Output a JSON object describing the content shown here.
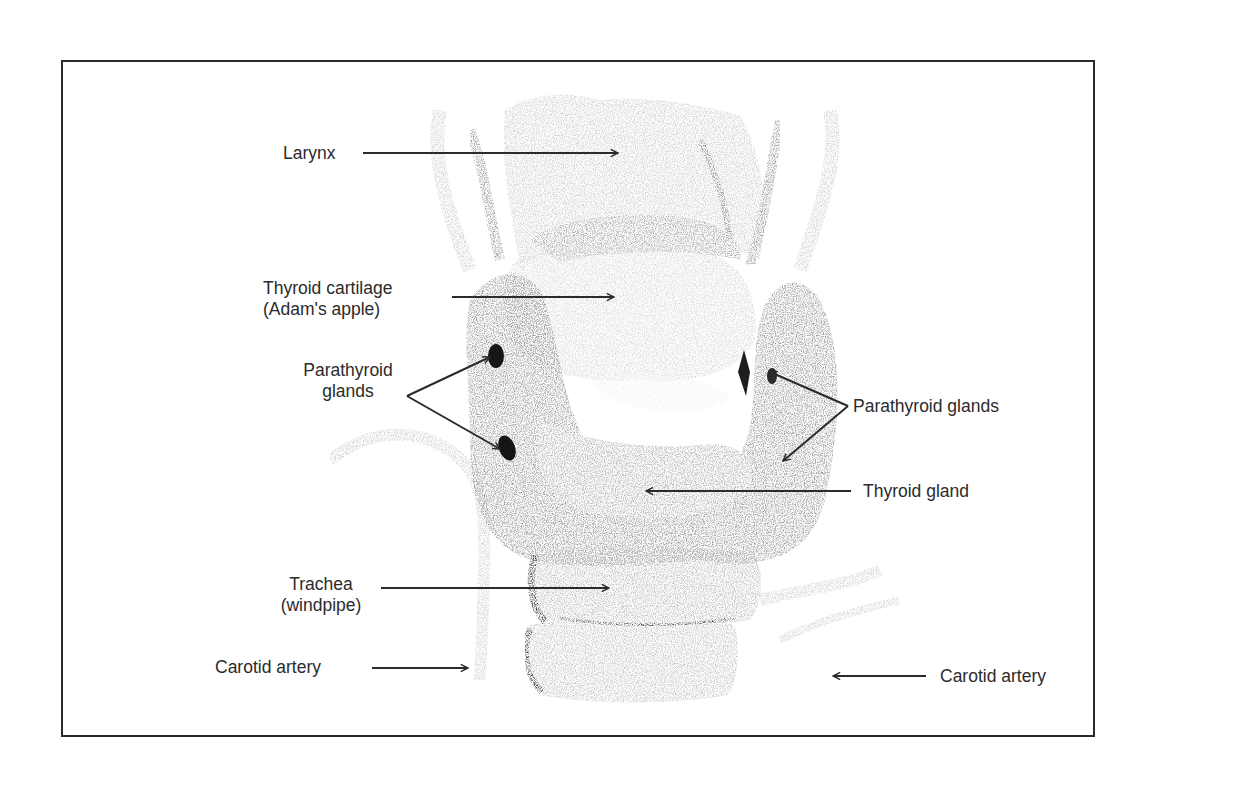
{
  "figure": {
    "type": "anatomical-illustration"
  },
  "labels": {
    "larynx": "Larynx",
    "thyroid_cartilage_line1": "Thyroid cartilage",
    "thyroid_cartilage_line2": "(Adam's apple)",
    "parathyroid_left_line1": "Parathyroid",
    "parathyroid_left_line2": "glands",
    "parathyroid_right": "Parathyroid glands",
    "thyroid_gland": "Thyroid gland",
    "trachea_line1": "Trachea",
    "trachea_line2": "(windpipe)",
    "carotid_left": "Carotid artery",
    "carotid_right": "Carotid artery"
  },
  "colors": {
    "ink": "#2b2b2b",
    "frame": "#2a2a2a",
    "tissue_dark": "#5a5a5a",
    "tissue_mid": "#9a9a9a",
    "tissue_light": "#c8c8c8",
    "gland_dark": "#151515",
    "background": "#ffffff"
  }
}
